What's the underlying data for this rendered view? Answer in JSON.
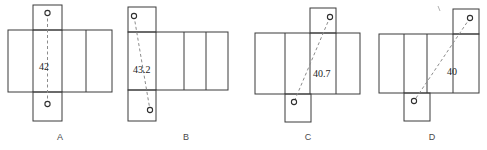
{
  "figure": {
    "title": "",
    "width": 487,
    "height": 150,
    "colors": {
      "outline": "#3a3a3a",
      "path": "#8c8c8c",
      "endpoint_fill": "#ffffff",
      "endpoint_stroke": "#2f2f2f",
      "label_text": "#1c1c1c",
      "letter_text": "#4a4a4a",
      "background": "#ffffff"
    },
    "panels": [
      {
        "letter": "A",
        "distance_label": "42",
        "label_x": 39,
        "label_y": 70,
        "letter_x": 60,
        "letter_y": 140,
        "band": {
          "x": 8,
          "y": 30,
          "w": 104,
          "h": 62
        },
        "band_dividers": [
          33,
          62,
          86
        ],
        "top_flap": {
          "x": 33,
          "y": 5,
          "w": 29,
          "h": 25
        },
        "bottom_flap": {
          "x": 33,
          "y": 92,
          "w": 29,
          "h": 29
        },
        "path": {
          "x1": 47.5,
          "y1": 13,
          "x2": 47.5,
          "y2": 104
        },
        "points": [
          {
            "cx": 47.5,
            "cy": 13,
            "r": 2.6
          },
          {
            "cx": 47.5,
            "cy": 104,
            "r": 2.6
          }
        ]
      },
      {
        "letter": "B",
        "distance_label": "43.2",
        "label_x": 133,
        "label_y": 73,
        "letter_x": 186,
        "letter_y": 140,
        "band": {
          "x": 128,
          "y": 32,
          "w": 100,
          "h": 58
        },
        "band_dividers": [
          156,
          184,
          206
        ],
        "top_flap": {
          "x": 128,
          "y": 7,
          "w": 28,
          "h": 25
        },
        "bottom_flap": {
          "x": 128,
          "y": 90,
          "w": 28,
          "h": 31
        },
        "path": {
          "x1": 134,
          "y1": 16,
          "x2": 150,
          "y2": 110
        },
        "points": [
          {
            "cx": 134,
            "cy": 16,
            "r": 2.6
          },
          {
            "cx": 150,
            "cy": 110,
            "r": 2.6
          }
        ]
      },
      {
        "letter": "C",
        "distance_label": "40.7",
        "label_x": 313,
        "label_y": 77,
        "letter_x": 308,
        "letter_y": 140,
        "band": {
          "x": 255,
          "y": 33,
          "w": 105,
          "h": 61
        },
        "band_dividers": [
          285,
          310,
          336
        ],
        "top_flap": {
          "x": 310,
          "y": 8,
          "w": 26,
          "h": 25
        },
        "bottom_flap": {
          "x": 285,
          "y": 94,
          "w": 26,
          "h": 28
        },
        "path": {
          "x1": 330,
          "y1": 17,
          "x2": 294,
          "y2": 102
        },
        "points": [
          {
            "cx": 330,
            "cy": 17,
            "r": 2.6
          },
          {
            "cx": 294,
            "cy": 102,
            "r": 2.6
          }
        ]
      },
      {
        "letter": "D",
        "distance_label": "40",
        "label_x": 447,
        "label_y": 75,
        "letter_x": 432,
        "letter_y": 140,
        "band": {
          "x": 379,
          "y": 34,
          "w": 100,
          "h": 59
        },
        "band_dividers": [
          404,
          427,
          453
        ],
        "top_flap": {
          "x": 453,
          "y": 9,
          "w": 26,
          "h": 25
        },
        "bottom_flap": {
          "x": 404,
          "y": 93,
          "w": 26,
          "h": 28
        },
        "path": {
          "x1": 470,
          "y1": 18,
          "x2": 414,
          "y2": 101
        },
        "points": [
          {
            "cx": 470,
            "cy": 18,
            "r": 2.6
          },
          {
            "cx": 414,
            "cy": 101,
            "r": 2.6
          }
        ]
      }
    ],
    "stray_mark": {
      "x1": 438,
      "y1": 6,
      "x2": 440,
      "y2": 11
    }
  }
}
